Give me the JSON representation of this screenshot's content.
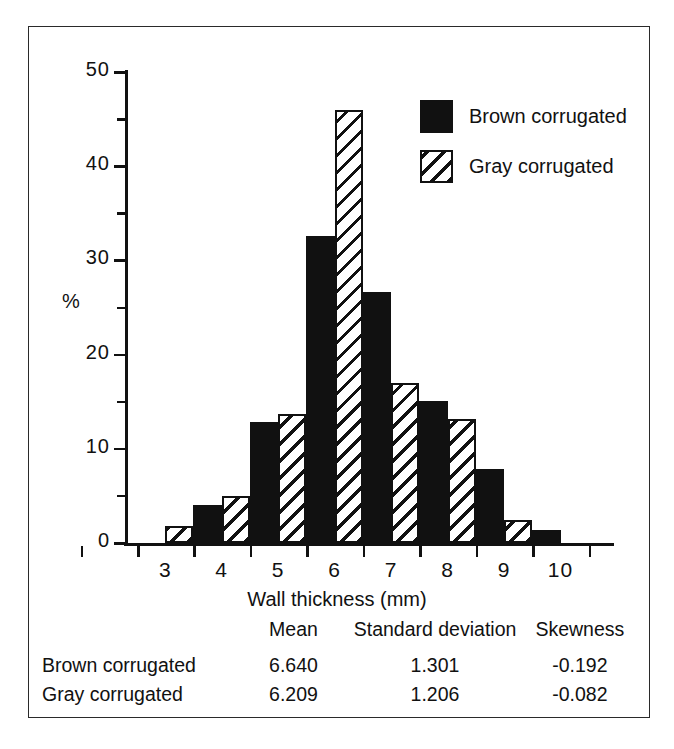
{
  "chart_data": {
    "type": "bar",
    "title": "",
    "xlabel": "Wall thickness (mm)",
    "ylabel": "%",
    "categories": [
      "3",
      "4",
      "5",
      "6",
      "7",
      "8",
      "9",
      "10"
    ],
    "xtick_labels": [
      "3",
      "4",
      "5",
      "6",
      "7",
      "8",
      "9",
      "10"
    ],
    "ytick_labels": [
      "0",
      "10",
      "20",
      "30",
      "40",
      "50"
    ],
    "ytick_values": [
      0,
      10,
      20,
      30,
      40,
      50
    ],
    "yminor_values": [
      5,
      15,
      25,
      35,
      45
    ],
    "ylim": [
      0,
      50
    ],
    "grid": false,
    "legend_position": "top-right",
    "series": [
      {
        "name": "Brown corrugated",
        "fill": "solid-black",
        "color": "#111111",
        "values": [
          0,
          4.0,
          12.8,
          32.6,
          26.6,
          15.1,
          7.9,
          1.4
        ]
      },
      {
        "name": "Gray corrugated",
        "fill": "diagonal-hatch",
        "color": "#111111",
        "values": [
          1.8,
          5.0,
          13.7,
          46.0,
          17.0,
          13.2,
          2.4,
          0
        ]
      }
    ]
  },
  "legend": {
    "items": [
      {
        "label": "Brown corrugated",
        "swatch": "solid-black-swatch"
      },
      {
        "label": "Gray corrugated",
        "swatch": "hatched-swatch"
      }
    ]
  },
  "stats_table": {
    "columns": [
      "Mean",
      "Standard deviation",
      "Skewness"
    ],
    "rows": [
      {
        "label": "Brown corrugated",
        "mean": "6.640",
        "sd": "1.301",
        "skewness": "-0.192"
      },
      {
        "label": "Gray corrugated",
        "mean": "6.209",
        "sd": "1.206",
        "skewness": "-0.082"
      }
    ]
  }
}
